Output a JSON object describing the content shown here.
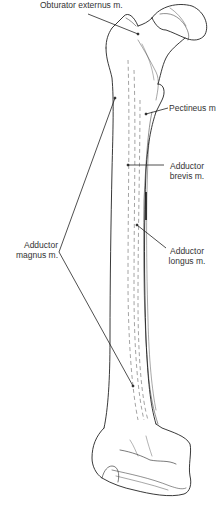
{
  "figure": {
    "labels": [
      {
        "id": "obturator_externus",
        "text": "Obturator externus m."
      },
      {
        "id": "pectineus",
        "text": "Pectineus m."
      },
      {
        "id": "adductor_brevis",
        "line1": "Adductor",
        "line2": "brevis m."
      },
      {
        "id": "adductor_longus",
        "line1": "Adductor",
        "line2": "longus m."
      },
      {
        "id": "adductor_magnus",
        "line1": "Adductor",
        "line2": "magnus m."
      }
    ],
    "colors": {
      "line": "#222222",
      "text": "#333333",
      "dashed": "#9a9a9a",
      "background": "#ffffff"
    }
  }
}
